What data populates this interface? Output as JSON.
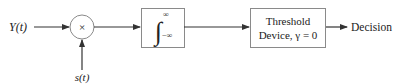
{
  "diagram": {
    "input": {
      "label": "Y(t)"
    },
    "multiplier": {
      "symbol": "×"
    },
    "reference": {
      "label": "s(t)"
    },
    "integrator": {
      "upper_limit": "∞",
      "lower_limit": "−∞",
      "symbol": "∫"
    },
    "threshold_device": {
      "line1": "Threshold",
      "line2": "Device, γ = 0"
    },
    "output": {
      "label": "Decision"
    },
    "colors": {
      "stroke": "#555555",
      "box_stroke": "#8a8a8a",
      "text": "#222222"
    }
  }
}
